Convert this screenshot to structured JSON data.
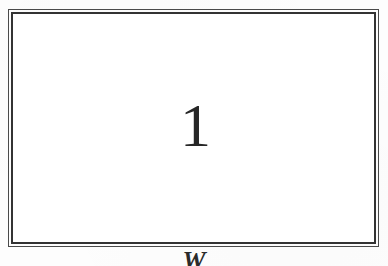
{
  "page": {
    "background_color": "#fdfdfd",
    "width": 388,
    "height": 266
  },
  "frame": {
    "style": "double-rule",
    "outer_rule_color": "#4a4a4a",
    "inner_rule_color": "#333333",
    "fill_color": "#ffffff"
  },
  "figure": {
    "number": "1",
    "number_color": "#272727"
  },
  "caption": {
    "visible_fragment": "W",
    "color": "#2b2b2b",
    "note": "clipped by bottom edge of page"
  }
}
